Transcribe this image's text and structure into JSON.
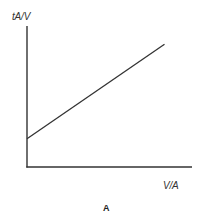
{
  "chart_data": {
    "type": "line",
    "title": "",
    "caption": "A",
    "xlabel": "V/A",
    "ylabel": "tA/V",
    "x": [
      0,
      1
    ],
    "series": [
      {
        "name": "tA/V vs V/A",
        "values": [
          0.2,
          0.87
        ]
      }
    ],
    "xlim": [
      0,
      1.2
    ],
    "ylim": [
      0,
      1
    ],
    "grid": false,
    "legend": null,
    "ticks": false,
    "annotations": [
      "Positive slope with positive y-intercept"
    ]
  },
  "colors": {
    "axis": "#333333",
    "line": "#333333",
    "text": "#333333"
  }
}
